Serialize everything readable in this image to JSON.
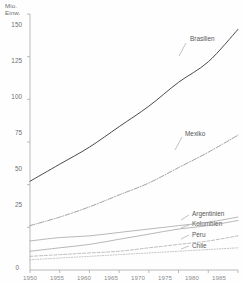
{
  "chart_data": {
    "type": "line",
    "title": "",
    "subtitle": "",
    "xlabel": "",
    "ylabel": "Mio.\nEinw.",
    "ylabel_lines": [
      "Mio.",
      "Einw."
    ],
    "ylim": [
      0,
      150
    ],
    "xlim": [
      1950,
      1985
    ],
    "grid": false,
    "legend_position": "inline-right",
    "y_ticks": [
      150,
      125,
      100,
      75,
      50,
      25,
      0
    ],
    "y_tick_labels": [
      "150",
      "125",
      "100",
      "75",
      "50",
      "25",
      "0"
    ],
    "x_ticks": [
      1950,
      1955,
      1960,
      1965,
      1970,
      1975,
      1980,
      1985
    ],
    "x_tick_labels": [
      "1950",
      "1955",
      "1960",
      "1965",
      "1970",
      "1975",
      "1980",
      "1985"
    ],
    "x": [
      1950,
      1955,
      1960,
      1965,
      1970,
      1975,
      1980,
      1985
    ],
    "series": [
      {
        "name": "Brasilien",
        "label": "Brasilien",
        "style": "solid",
        "color": "#4a4a4a",
        "values": [
          52,
          62,
          72,
          84,
          96,
          110,
          122,
          141
        ]
      },
      {
        "name": "Mexiko",
        "label": "Mexiko",
        "style": "dashdot",
        "color": "#8a8a8a",
        "values": [
          26,
          31,
          37,
          44,
          51,
          60,
          69,
          79
        ]
      },
      {
        "name": "Argentinien",
        "label": "Argentinien",
        "style": "solid-thin",
        "color": "#9a9a9a",
        "values": [
          17,
          19,
          20,
          22,
          24,
          26,
          28,
          31
        ]
      },
      {
        "name": "Kolumbien",
        "label": "Kolumbien",
        "style": "solid-thin",
        "color": "#9a9a9a",
        "values": [
          11,
          13,
          15,
          18,
          21,
          24,
          26,
          29
        ]
      },
      {
        "name": "Peru",
        "label": "Peru",
        "style": "dashed",
        "color": "#a5a5a5",
        "values": [
          8,
          9,
          10,
          11,
          13,
          15,
          17,
          20
        ]
      },
      {
        "name": "Chile",
        "label": "Chile",
        "style": "dotted",
        "color": "#ababab",
        "values": [
          6,
          7,
          8,
          9,
          10,
          11,
          12,
          13
        ]
      }
    ]
  },
  "axis": {
    "unit_label": "Mio.\nEinw.",
    "y_labels": [
      {
        "text": "150",
        "top": 22
      },
      {
        "text": "125",
        "top": 58
      },
      {
        "text": "100",
        "top": 94
      },
      {
        "text": "75",
        "top": 130
      },
      {
        "text": "50",
        "top": 166
      },
      {
        "text": "25",
        "top": 202
      },
      {
        "text": "0",
        "top": 267
      }
    ],
    "x_labels": [
      {
        "text": "1950",
        "left": 16
      },
      {
        "text": "1955",
        "left": 43
      },
      {
        "text": "1960",
        "left": 70
      },
      {
        "text": "1965",
        "left": 97
      },
      {
        "text": "1970",
        "left": 124
      },
      {
        "text": "1975",
        "left": 151
      },
      {
        "text": "1980",
        "left": 178
      },
      {
        "text": "1985",
        "left": 205
      }
    ]
  },
  "annotations": {
    "brasilien": {
      "text": "Brasilien",
      "left": 190,
      "top": 36
    },
    "mexiko": {
      "text": "Mexiko",
      "left": 185,
      "top": 131
    },
    "argentinien": {
      "text": "Argentinien",
      "left": 192,
      "top": 211
    },
    "kolumbien": {
      "text": "Kolumbien",
      "left": 192,
      "top": 221
    },
    "peru": {
      "text": "Peru",
      "left": 192,
      "top": 232
    },
    "chile": {
      "text": "Chile",
      "left": 192,
      "top": 243
    }
  },
  "colors": {
    "axis": "#a8a8a8",
    "text": "#6e6e6e",
    "series_primary": "#4a4a4a",
    "series_secondary": "#8a8a8a",
    "background": "#fefefe"
  }
}
